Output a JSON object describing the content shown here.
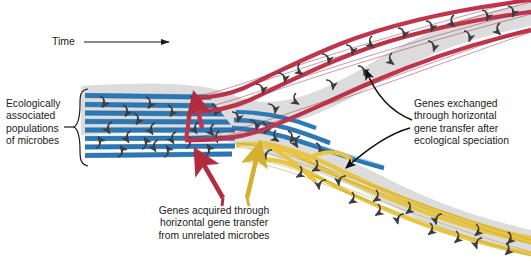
{
  "figure": {
    "background_color": "#ffffff",
    "envelope_color": "#dcdcdc",
    "axis": {
      "label": "Time",
      "direction": "left-to-right",
      "arrow_from_x": 86,
      "arrow_to_x": 172,
      "y": 42
    },
    "labels": {
      "time": "Time",
      "ecological_populations": "Ecologically\nassociated\npopulations\nof microbes",
      "genes_acquired": "Genes acquired through\nhorizontal gene transfer\nfrom unrelated microbes",
      "genes_exchanged": "Genes exchanged\nthrough horizontal\ngene transfer after\necological speciation"
    },
    "lineages": {
      "ancestral": {
        "name": "ancestral-population",
        "color": "#2a7ab9",
        "color_dark": "#1c5c8f",
        "line_count": 8,
        "orientation": "horizontal"
      },
      "upper_branch": {
        "name": "upper-daughter-lineage",
        "color": "#c0354c",
        "color_dark": "#97253a",
        "line_count": 3,
        "direction": "up-right"
      },
      "lower_branch": {
        "name": "lower-daughter-lineage",
        "color": "#e8c541",
        "color_dark": "#b99a20",
        "line_count": 3,
        "direction": "down-right"
      }
    },
    "transfer_arrows": {
      "color": "#3d3d3d",
      "description": "curved horizontal gene transfer connectors between lineage lines"
    },
    "acquired_arrows": [
      {
        "name": "red-acquisition-arrow",
        "color": "#b32b3f"
      },
      {
        "name": "yellow-acquisition-arrow",
        "color": "#d4b02e"
      }
    ],
    "callout_arrows": {
      "color": "#111111",
      "count": 2,
      "targets": [
        "upper-daughter-lineage",
        "lower-daughter-lineage"
      ]
    }
  }
}
